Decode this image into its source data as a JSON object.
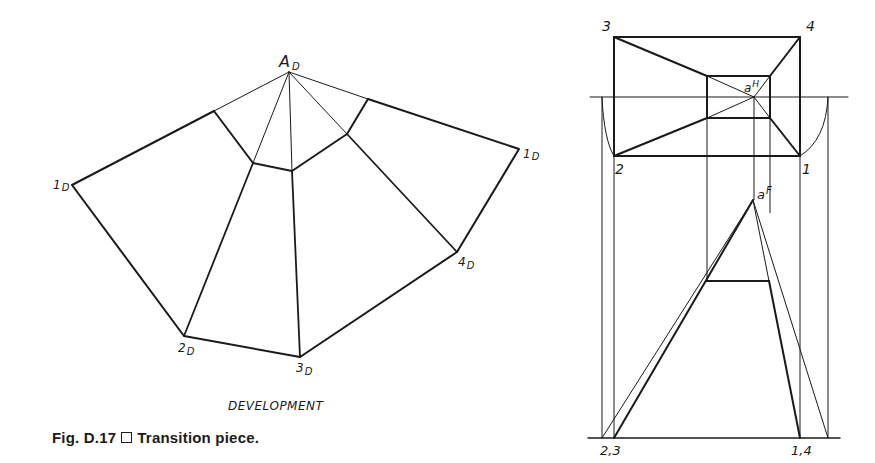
{
  "figure": {
    "number": "Fig. D.17",
    "separator_icon": "square-icon",
    "title": "Transition piece."
  },
  "development": {
    "caption": "DEVELOPMENT",
    "labels": {
      "apex": "A",
      "apex_sub": "D",
      "p1_left": "1",
      "p1_left_sub": "D",
      "p1_right": "1",
      "p1_right_sub": "D",
      "p2": "2",
      "p2_sub": "D",
      "p3": "3",
      "p3_sub": "D",
      "p4": "4",
      "p4_sub": "D"
    }
  },
  "top_view": {
    "labels": {
      "c3": "3",
      "c4": "4",
      "c2": "2",
      "c1": "1",
      "apex": "a",
      "apex_sup": "H"
    }
  },
  "front_view": {
    "labels": {
      "apex": "a",
      "apex_sup": "F",
      "left_base": "2,3",
      "right_base": "1,4"
    }
  },
  "colors": {
    "ink": "#1a1a1a",
    "paper": "#ffffff"
  }
}
